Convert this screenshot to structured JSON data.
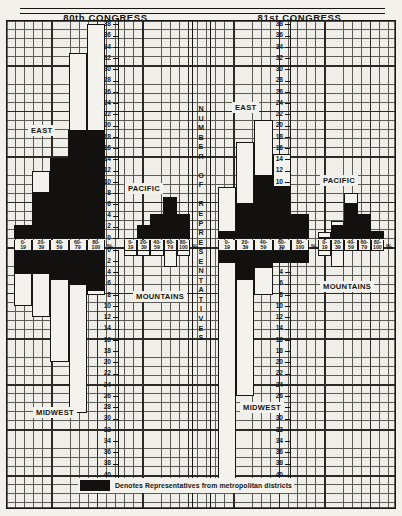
{
  "figure": {
    "vertical_axis_label": "NUMBER OF REPRESENTATIVES",
    "x_axis_unit": "%",
    "legend_text": "Denotes Representatives from metropolitan districts",
    "legend_swatch_color": "#121110"
  },
  "congresses": [
    {
      "id": "c80",
      "title": "80th CONGRESS"
    },
    {
      "id": "c81",
      "title": "81st CONGRESS"
    }
  ],
  "x_categories": [
    {
      "top": "0-",
      "bottom": "19"
    },
    {
      "top": "20-",
      "bottom": "39"
    },
    {
      "top": "40-",
      "bottom": "59"
    },
    {
      "top": "60-",
      "bottom": "79"
    },
    {
      "top": "80-",
      "bottom": "100"
    }
  ],
  "y_ticks_up": [
    "0",
    "2",
    "4",
    "6",
    "8",
    "10",
    "12",
    "14",
    "16",
    "18",
    "20",
    "22",
    "24",
    "26",
    "28",
    "30",
    "32",
    "34",
    "36",
    "38"
  ],
  "y_ticks_down": [
    "0",
    "2",
    "4",
    "6",
    "8",
    "10",
    "12",
    "14",
    "16",
    "18",
    "20",
    "22",
    "24",
    "26",
    "28",
    "30",
    "32",
    "34",
    "36",
    "38",
    "40",
    "42"
  ],
  "regions": {
    "east": "EAST",
    "pacific": "PACIFIC",
    "mountains": "MOUNTAINS",
    "midwest": "MIDWEST"
  },
  "chart_data": {
    "type": "bar",
    "xlabel": "%",
    "ylabel": "NUMBER OF REPRESENTATIVES",
    "categories": [
      "0-19",
      "20-39",
      "40-59",
      "60-79",
      "80-100"
    ],
    "legend": [
      "Denotes Representatives from metropolitan districts"
    ],
    "grid": true,
    "panels": [
      {
        "congress": "80th CONGRESS",
        "region": "EAST",
        "direction": "up",
        "ylim": [
          0,
          39
        ],
        "values": [
          2,
          12,
          14,
          33,
          38
        ],
        "metro_values": [
          2,
          8,
          14,
          19,
          19
        ]
      },
      {
        "congress": "80th CONGRESS",
        "region": "PACIFIC",
        "direction": "up",
        "ylim": [
          0,
          39
        ],
        "values": [
          0,
          2,
          4,
          7,
          4
        ],
        "metro_values": [
          0,
          2,
          4,
          7,
          4
        ]
      },
      {
        "congress": "80th CONGRESS",
        "region": "MOUNTAINS",
        "direction": "down",
        "ylim": [
          0,
          43
        ],
        "values": [
          1,
          1,
          1,
          3,
          1
        ],
        "metro_values": [
          0,
          0,
          0,
          0,
          0
        ]
      },
      {
        "congress": "80th CONGRESS",
        "region": "MIDWEST",
        "direction": "down",
        "ylim": [
          0,
          43
        ],
        "values": [
          10,
          12,
          20,
          29,
          8
        ],
        "metro_values": [
          4,
          4,
          5,
          6,
          7
        ]
      },
      {
        "congress": "81st CONGRESS",
        "region": "EAST",
        "direction": "up",
        "ylim": [
          0,
          39
        ],
        "values": [
          9,
          17,
          21,
          15,
          4
        ],
        "metro_values": [
          1,
          6,
          11,
          9,
          4
        ]
      },
      {
        "congress": "81st CONGRESS",
        "region": "PACIFIC",
        "direction": "up",
        "ylim": [
          0,
          39
        ],
        "values": [
          1,
          3,
          8,
          4,
          1
        ],
        "metro_values": [
          0,
          2,
          6,
          4,
          1
        ]
      },
      {
        "congress": "81st CONGRESS",
        "region": "MOUNTAINS",
        "direction": "down",
        "ylim": [
          0,
          43
        ],
        "values": [
          1,
          3,
          0,
          0,
          0
        ],
        "metro_values": [
          0,
          0,
          0,
          0,
          0
        ]
      },
      {
        "congress": "81st CONGRESS",
        "region": "MIDWEST",
        "direction": "down",
        "ylim": [
          0,
          43
        ],
        "values": [
          41,
          26,
          8,
          2,
          2
        ],
        "metro_values": [
          2,
          5,
          3,
          2,
          2
        ]
      }
    ]
  }
}
